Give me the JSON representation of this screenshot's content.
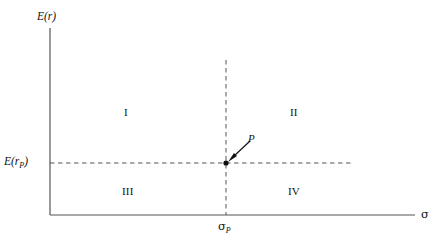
{
  "figure": {
    "kind": "quadrant-diagram",
    "background_color": "#ffffff",
    "line_color": "#3a3a3a",
    "text_color": "#111111"
  },
  "axes": {
    "y_title": "E(r)",
    "y_title_plain": "E(r)",
    "x_title": "σ",
    "x_title_plain": "sigma",
    "origin": {
      "x": 50,
      "y": 215
    },
    "y_top": {
      "x": 50,
      "y": 28
    },
    "x_right": {
      "x": 415,
      "y": 215
    }
  },
  "reference_lines": {
    "vertical": {
      "label_main": "σ",
      "label_sub": "P",
      "value_x": 226,
      "from_y": 60,
      "to_y": 215,
      "style": "dashed"
    },
    "horizontal": {
      "label_main": "E(r",
      "label_sub": "P",
      "label_close": ")",
      "value_y": 163,
      "from_x": 50,
      "to_x": 352,
      "style": "dashed"
    }
  },
  "point": {
    "name": "P",
    "label": "P",
    "x": 226,
    "y": 163,
    "radius": 2.6,
    "annotation_arrow": {
      "from": {
        "x": 250,
        "y": 141
      },
      "to": {
        "x": 230,
        "y": 160
      }
    }
  },
  "quadrants": [
    {
      "id": "I",
      "label": "I",
      "position": "upper-left"
    },
    {
      "id": "II",
      "label": "II",
      "position": "upper-right"
    },
    {
      "id": "III",
      "label": "III",
      "position": "lower-left"
    },
    {
      "id": "IV",
      "label": "IV",
      "position": "lower-right"
    }
  ],
  "labels": {
    "y_axis_title": "E(r)",
    "x_axis_title": "σ",
    "e_rp_main": "E(r",
    "e_rp_sub": "P",
    "e_rp_close": ")",
    "sigma_p_main": "σ",
    "sigma_p_sub": "P",
    "point_label": "P",
    "quad_1": "I",
    "quad_2": "II",
    "quad_3": "III",
    "quad_4": "IV"
  }
}
